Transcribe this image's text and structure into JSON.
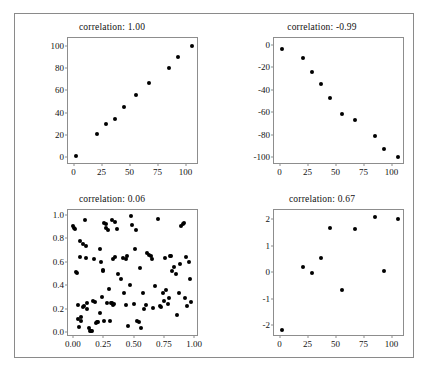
{
  "figure": {
    "background": "#ffffff",
    "frame_color": "#8a8a8a",
    "axis_color": "#8d8d8d",
    "marker_color": "#000000"
  },
  "chart_data": [
    {
      "type": "scatter",
      "title": "correlation:  1.00",
      "correlation": 1.0,
      "xlabel": "",
      "ylabel": "",
      "xlim": [
        -5,
        112
      ],
      "ylim": [
        -7,
        107
      ],
      "xticks": [
        0,
        25,
        50,
        75,
        100
      ],
      "xticklabels": [
        "0",
        "25",
        "50",
        "75",
        "100"
      ],
      "yticks": [
        0,
        20,
        40,
        60,
        80,
        100
      ],
      "yticklabels": [
        "0",
        "20",
        "40",
        "60",
        "80",
        "100"
      ],
      "grid": false,
      "legend": "none",
      "x": [
        2,
        21,
        29,
        37,
        45,
        56,
        67,
        85,
        93,
        106
      ],
      "y": [
        1,
        21,
        30,
        34,
        45,
        56,
        67,
        80,
        90,
        100
      ]
    },
    {
      "type": "scatter",
      "title": "correlation:  -0.99",
      "correlation": -0.99,
      "xlabel": "",
      "ylabel": "",
      "xlim": [
        -5,
        112
      ],
      "ylim": [
        -107,
        6
      ],
      "xticks": [
        0,
        25,
        50,
        75,
        100
      ],
      "xticklabels": [
        "0",
        "25",
        "50",
        "75",
        "100"
      ],
      "yticks": [
        0,
        -20,
        -40,
        -60,
        -80,
        -100
      ],
      "yticklabels": [
        "0",
        "-20",
        "-40",
        "-60",
        "-80",
        "-100"
      ],
      "grid": false,
      "legend": "none",
      "x": [
        2,
        21,
        29,
        37,
        45,
        56,
        67,
        85,
        93,
        106
      ],
      "y": [
        -4,
        -12,
        -24,
        -35,
        -47,
        -62,
        -67,
        -81,
        -93,
        -100
      ]
    },
    {
      "type": "scatter",
      "title": "correlation:  0.06",
      "correlation": 0.06,
      "xlabel": "",
      "ylabel": "",
      "xlim": [
        -0.04,
        1.04
      ],
      "ylim": [
        -0.04,
        1.04
      ],
      "xticks": [
        0.0,
        0.25,
        0.5,
        0.75,
        1.0
      ],
      "xticklabels": [
        "0.00",
        "0.25",
        "0.50",
        "0.75",
        "1.00"
      ],
      "yticks": [
        0.0,
        0.2,
        0.4,
        0.6,
        0.8,
        1.0
      ],
      "yticklabels": [
        "0.0",
        "0.2",
        "0.4",
        "0.6",
        "0.8",
        "1.0"
      ],
      "grid": false,
      "legend": "none",
      "x": [
        0.005,
        0.012,
        0.02,
        0.03,
        0.035,
        0.04,
        0.045,
        0.05,
        0.055,
        0.06,
        0.065,
        0.07,
        0.08,
        0.085,
        0.095,
        0.1,
        0.105,
        0.11,
        0.115,
        0.12,
        0.13,
        0.14,
        0.15,
        0.155,
        0.17,
        0.175,
        0.185,
        0.19,
        0.2,
        0.21,
        0.22,
        0.225,
        0.235,
        0.24,
        0.245,
        0.25,
        0.255,
        0.26,
        0.27,
        0.275,
        0.285,
        0.29,
        0.3,
        0.305,
        0.315,
        0.32,
        0.325,
        0.33,
        0.335,
        0.34,
        0.345,
        0.35,
        0.36,
        0.37,
        0.4,
        0.415,
        0.425,
        0.435,
        0.44,
        0.45,
        0.455,
        0.47,
        0.48,
        0.49,
        0.5,
        0.51,
        0.52,
        0.53,
        0.545,
        0.555,
        0.56,
        0.575,
        0.59,
        0.6,
        0.615,
        0.63,
        0.645,
        0.655,
        0.66,
        0.68,
        0.7,
        0.715,
        0.73,
        0.745,
        0.755,
        0.76,
        0.77,
        0.785,
        0.79,
        0.8,
        0.81,
        0.82,
        0.835,
        0.85,
        0.86,
        0.875,
        0.885,
        0.895,
        0.905,
        0.915,
        0.925,
        0.935,
        0.945,
        0.955,
        0.965,
        0.975
      ],
      "y": [
        0.9,
        0.885,
        0.875,
        0.51,
        0.505,
        0.235,
        0.115,
        0.045,
        0.64,
        0.78,
        0.13,
        0.1,
        0.755,
        0.215,
        0.225,
        0.955,
        0.73,
        0.63,
        0.245,
        0.2,
        0.035,
        0.01,
        0.015,
        0.015,
        0.27,
        0.62,
        0.26,
        0.075,
        0.085,
        0.085,
        0.71,
        0.16,
        0.595,
        0.3,
        0.53,
        0.525,
        0.095,
        0.93,
        0.925,
        0.885,
        0.245,
        0.87,
        0.365,
        0.1,
        0.245,
        0.245,
        0.955,
        0.62,
        0.235,
        0.24,
        0.64,
        0.935,
        0.875,
        0.5,
        0.455,
        0.63,
        0.335,
        0.23,
        0.625,
        0.645,
        0.055,
        0.4,
        0.985,
        0.91,
        0.24,
        0.705,
        0.87,
        0.095,
        0.085,
        0.545,
        0.04,
        0.335,
        0.195,
        0.235,
        0.675,
        0.655,
        0.645,
        0.62,
        0.21,
        0.395,
        0.965,
        0.225,
        0.215,
        0.335,
        0.265,
        0.63,
        0.36,
        0.24,
        0.29,
        0.645,
        0.645,
        0.52,
        0.555,
        0.5,
        0.145,
        0.335,
        0.585,
        0.905,
        0.92,
        0.93,
        0.29,
        0.64,
        0.22,
        0.6,
        0.455,
        0.26
      ]
    },
    {
      "type": "scatter",
      "title": "correlation:  0.67",
      "correlation": 0.67,
      "xlabel": "",
      "ylabel": "",
      "xlim": [
        -5,
        112
      ],
      "ylim": [
        -2.45,
        2.35
      ],
      "xticks": [
        0,
        25,
        50,
        75,
        100
      ],
      "xticklabels": [
        "0",
        "25",
        "50",
        "75",
        "100"
      ],
      "yticks": [
        2,
        1,
        0,
        -1,
        -2
      ],
      "yticklabels": [
        "2",
        "1",
        "0",
        "-1",
        "-2"
      ],
      "grid": false,
      "legend": "none",
      "x": [
        2,
        21,
        29,
        37,
        45,
        56,
        67,
        85,
        93,
        106
      ],
      "y": [
        -2.18,
        0.18,
        -0.03,
        0.55,
        1.68,
        -0.67,
        1.62,
        2.08,
        0.05,
        2.02
      ]
    }
  ]
}
